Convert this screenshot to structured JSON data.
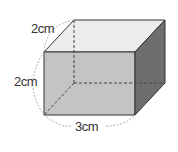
{
  "figure": {
    "type": "rectangular-prism",
    "labels": {
      "depth": "2cm",
      "height": "2cm",
      "width": "3cm"
    },
    "colors": {
      "top_face": "#ececec",
      "front_face": "#c4c4c4",
      "right_face": "#6e6e6e",
      "edge": "#333333",
      "hidden_edge": "#444444",
      "brace": "#999999"
    }
  }
}
